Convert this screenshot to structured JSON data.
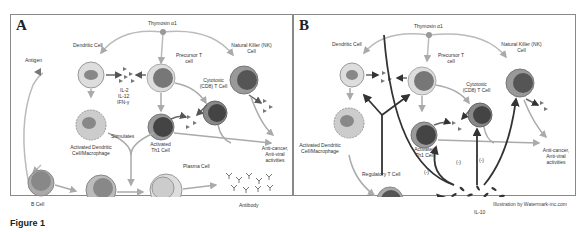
{
  "panels": [
    {
      "label": "A",
      "thymosin": "Thymosin α1",
      "dendritic": "Dendritic Cell",
      "antigen": "Antigen",
      "precursor": "Precursor T cell",
      "nk": "Natural Killer (NK) Cell",
      "cytotoxic": "Cytotoxic (CD8) T Cell",
      "cytokines": [
        "IL-2",
        "IL-12",
        "IFN-γ"
      ],
      "activated_dc": "Activated Dendritic Cell/Macrophage",
      "stimulates": "Stimulates",
      "activated_th1": "Activated Th1 Cell",
      "anticancer": "Anti-cancer, Anti-viral activities",
      "plasma": "Plasma Cell",
      "bcell": "B Cell",
      "antibody": "Antibody"
    },
    {
      "label": "B",
      "thymosin": "Thymosin α1",
      "dendritic": "Dendritic Cell",
      "precursor": "Precursor T cell",
      "nk": "Natural Killer (NK) Cell",
      "cytotoxic": "Cytotoxic (CD8) T Cell",
      "activated_dc": "Activated Dendritic Cell/Macrophage",
      "activated_th1": "Activated Th1 Cell",
      "anticancer": "Anti-cancer, Anti-viral activities",
      "regulatory": "Regulatory T Cell",
      "il10": "IL-10",
      "inhibit": "(-)"
    }
  ],
  "credit": "Illustration by Watermark-inc.com",
  "caption": "Figure 1"
}
